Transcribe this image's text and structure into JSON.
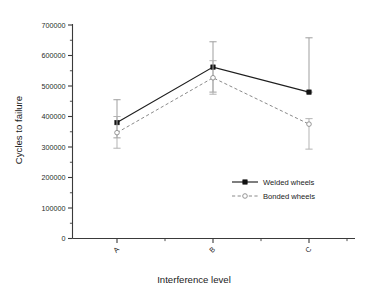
{
  "chart_data": {
    "type": "line",
    "title": "",
    "subtitle": "",
    "xlabel": "Interference level",
    "ylabel": "Cycles to failure",
    "categories": [
      "A",
      "B",
      "C"
    ],
    "ylim": [
      0,
      700000
    ],
    "ytick_labels": [
      "0",
      "100000",
      "200000",
      "300000",
      "400000",
      "500000",
      "600000",
      "700000"
    ],
    "ytick_values": [
      0,
      100000,
      200000,
      300000,
      400000,
      500000,
      600000,
      700000
    ],
    "yminor_ticks": true,
    "grid": false,
    "legend_position": "inside-right",
    "xtick_label_rotation": -45,
    "series": [
      {
        "name": "Welded wheels",
        "linestyle": "solid",
        "marker": "filled-square",
        "color": "#1e1e1e",
        "values": [
          380000,
          562000,
          480000
        ],
        "err_low": [
          330000,
          480000,
          480000
        ],
        "err_high": [
          455000,
          645000,
          658000
        ]
      },
      {
        "name": "Bonded wheels",
        "linestyle": "dashed",
        "marker": "open-circle",
        "color": "#8a8a8a",
        "values": [
          347000,
          527000,
          375000
        ],
        "err_low": [
          296000,
          473000,
          293000
        ],
        "err_high": [
          400000,
          583000,
          393000
        ]
      }
    ]
  },
  "legend": {
    "entries": [
      {
        "label": "Welded wheels"
      },
      {
        "label": "Bonded wheels"
      }
    ]
  },
  "axes": {
    "x_title": "Interference level",
    "y_title": "Cycles to failure",
    "x_categories": [
      "A",
      "B",
      "C"
    ],
    "y_labels": [
      "700000",
      "600000",
      "500000",
      "400000",
      "300000",
      "200000",
      "100000",
      "0"
    ]
  }
}
